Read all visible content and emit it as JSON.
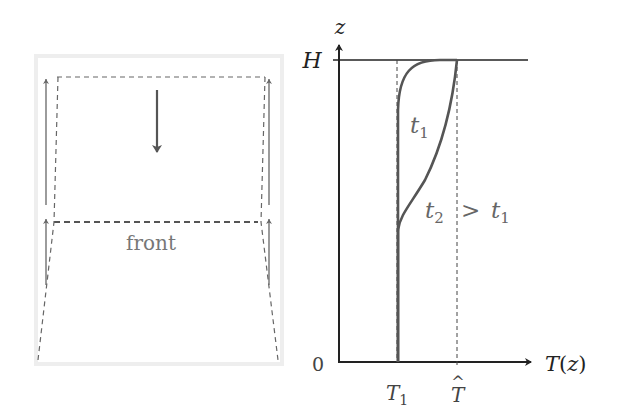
{
  "left_panel": {
    "front_label": "front"
  },
  "right_panel": {
    "y_axis_label": "z",
    "x_axis_label": "T(z)",
    "origin_label": "0",
    "top_label": "H",
    "tick_labels": [
      "T₁",
      "T̂"
    ],
    "t1_label": "t",
    "t1_sub": "1",
    "t2_label": "t",
    "t2_sub": "2",
    "gt": ">",
    "t1b_label": "t",
    "t1b_sub": "1",
    "T1_main": "T",
    "T1_sub": "1",
    "That_main": "T",
    "That_hat": "^"
  },
  "colors": {
    "axis": "#222222",
    "curve": "#555555",
    "dashed": "#444444",
    "label_gray": "#777777",
    "panel_border": "#eeeeee"
  }
}
